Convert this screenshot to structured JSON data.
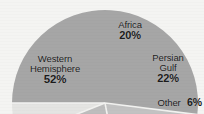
{
  "chart_data": {
    "type": "pie",
    "title": "",
    "subtitle": "",
    "xlabel": "",
    "ylabel": "",
    "legend_position": "none",
    "grid": false,
    "labels_inside": true,
    "categories": [
      "Western Hemisphere",
      "Africa",
      "Persian Gulf",
      "Other"
    ],
    "values": [
      52,
      20,
      22,
      6
    ],
    "value_unit": "%",
    "slices": [
      {
        "name": "Western Hemisphere",
        "label_line1": "Western",
        "label_line2": "Hemisphere",
        "value": 52,
        "value_text": "52%",
        "color": "#a6a6a6"
      },
      {
        "name": "Africa",
        "label_line1": "Africa",
        "label_line2": "",
        "value": 20,
        "value_text": "20%",
        "color": "#c2c2c2"
      },
      {
        "name": "Persian Gulf",
        "label_line1": "Persian",
        "label_line2": "Gulf",
        "value": 22,
        "value_text": "22%",
        "color": "#bdbdbd"
      },
      {
        "name": "Other",
        "label_line1": "Other",
        "label_line2": "",
        "value": 6,
        "value_text": "6%",
        "color": "#e4e4e2"
      }
    ]
  },
  "colors": {
    "background": "#f4f4f2",
    "text": "#1b1b1b",
    "slice_divider": "#f2f2f0",
    "western_hemisphere": "#a6a6a6",
    "africa": "#c2c2c2",
    "persian_gulf": "#bdbdbd",
    "other": "#e4e4e2"
  }
}
